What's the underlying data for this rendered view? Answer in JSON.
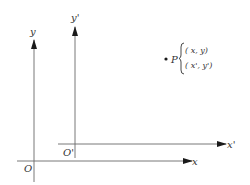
{
  "diagram": {
    "axes": {
      "x": {
        "label": "x"
      },
      "y": {
        "label": "y"
      },
      "x_prime": {
        "label": "x'"
      },
      "y_prime": {
        "label": "y'"
      }
    },
    "origins": {
      "O": {
        "label": "O"
      },
      "O_prime": {
        "label": "O'"
      }
    },
    "point": {
      "name": "P",
      "coords_original": "( x, y)",
      "coords_new": "( x', y')"
    },
    "colors": {
      "line": "#6a6a6a",
      "arrow": "#1a1a1a",
      "text": "#333333"
    }
  }
}
